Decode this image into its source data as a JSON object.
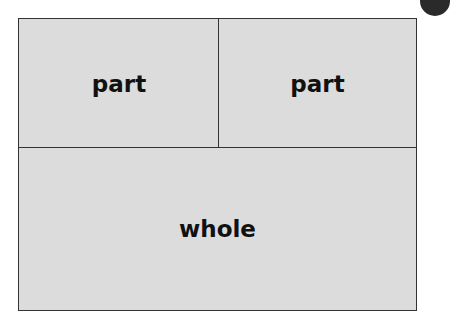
{
  "diagram": {
    "parts": [
      {
        "label": "part"
      },
      {
        "label": "part"
      }
    ],
    "whole": {
      "label": "whole"
    },
    "colors": {
      "fill": "#dcdcdc",
      "border": "#333333",
      "text": "#111111"
    }
  }
}
